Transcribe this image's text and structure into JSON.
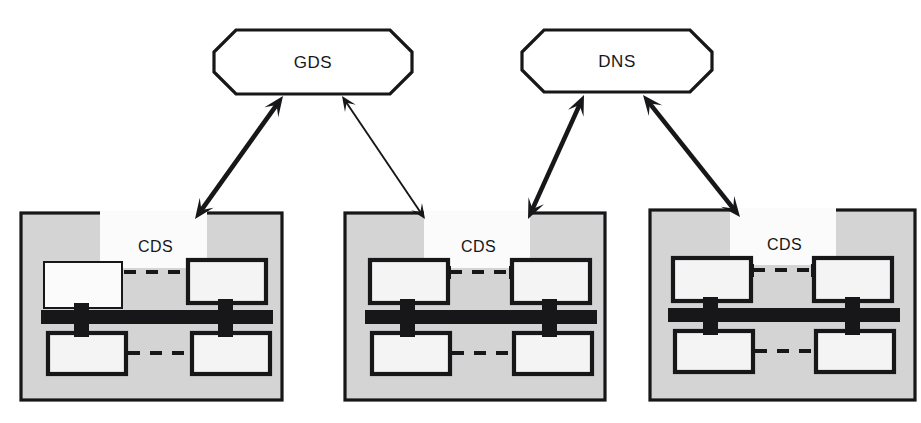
{
  "diagram": {
    "background_color": "#ffffff",
    "line_color": "#17171a",
    "cell_fill_color": "#d4d4d4",
    "inner_rect_color": "#f4f4f4",
    "label_band_color": "#fbfbfb"
  },
  "top_nodes": [
    {
      "id": "gds",
      "label": "GDS",
      "shape": "octagon",
      "x": 214,
      "y": 30,
      "width": 198,
      "height": 64,
      "corner": 22
    },
    {
      "id": "dns",
      "label": "DNS",
      "shape": "octagon",
      "x": 522,
      "y": 30,
      "width": 190,
      "height": 62,
      "corner": 22
    }
  ],
  "cds_boxes": [
    {
      "id": "cds-1",
      "label": "CDS",
      "x": 21,
      "y": 213,
      "width": 261,
      "height": 187,
      "label_band": {
        "x": 100,
        "y": 213,
        "width": 107,
        "height": 55
      },
      "label_text_x": 138,
      "label_text_y": 252,
      "top_left_thin_border": true,
      "rects": [
        {
          "role": "top-left",
          "x": 44,
          "y": 262,
          "width": 78,
          "height": 46
        },
        {
          "role": "top-right",
          "x": 188,
          "y": 260,
          "width": 78,
          "height": 43
        },
        {
          "role": "bottom-left",
          "x": 48,
          "y": 333,
          "width": 78,
          "height": 41
        },
        {
          "role": "bottom-right",
          "x": 192,
          "y": 333,
          "width": 78,
          "height": 41
        }
      ],
      "bus": {
        "x": 41,
        "y": 310,
        "width": 232,
        "height": 14
      },
      "stubs": [
        {
          "x": 74,
          "y": 303,
          "width": 15,
          "height": 34
        },
        {
          "x": 218,
          "y": 299,
          "width": 15,
          "height": 38
        }
      ],
      "dashes": [
        {
          "x1": 124,
          "y1": 272,
          "x2": 186,
          "y2": 272
        },
        {
          "x1": 128,
          "y1": 353,
          "x2": 190,
          "y2": 353
        }
      ],
      "dash_ticks": []
    },
    {
      "id": "cds-2",
      "label": "CDS",
      "x": 345,
      "y": 213,
      "width": 260,
      "height": 187,
      "label_band": {
        "x": 424,
        "y": 213,
        "width": 106,
        "height": 55
      },
      "label_text_x": 461,
      "label_text_y": 252,
      "top_left_thin_border": false,
      "rects": [
        {
          "role": "top-left",
          "x": 370,
          "y": 260,
          "width": 78,
          "height": 43
        },
        {
          "role": "top-right",
          "x": 512,
          "y": 260,
          "width": 78,
          "height": 43
        },
        {
          "role": "bottom-left",
          "x": 372,
          "y": 333,
          "width": 78,
          "height": 41
        },
        {
          "role": "bottom-right",
          "x": 514,
          "y": 333,
          "width": 78,
          "height": 41
        }
      ],
      "bus": {
        "x": 365,
        "y": 310,
        "width": 232,
        "height": 14
      },
      "stubs": [
        {
          "x": 400,
          "y": 299,
          "width": 15,
          "height": 38
        },
        {
          "x": 542,
          "y": 299,
          "width": 15,
          "height": 38
        }
      ],
      "dashes": [
        {
          "x1": 450,
          "y1": 272,
          "x2": 510,
          "y2": 272
        },
        {
          "x1": 452,
          "y1": 353,
          "x2": 512,
          "y2": 353
        }
      ],
      "dash_ticks": [
        {
          "x": 449,
          "y1": 266,
          "y2": 279
        },
        {
          "x": 511,
          "y1": 266,
          "y2": 279
        }
      ]
    },
    {
      "id": "cds-3",
      "label": "CDS",
      "x": 650,
      "y": 210,
      "width": 265,
      "height": 190,
      "label_band": {
        "x": 730,
        "y": 210,
        "width": 106,
        "height": 55
      },
      "label_text_x": 767,
      "label_text_y": 250,
      "top_left_thin_border": false,
      "rects": [
        {
          "role": "top-left",
          "x": 673,
          "y": 258,
          "width": 78,
          "height": 43
        },
        {
          "role": "top-right",
          "x": 814,
          "y": 258,
          "width": 78,
          "height": 43
        },
        {
          "role": "bottom-left",
          "x": 675,
          "y": 331,
          "width": 78,
          "height": 41
        },
        {
          "role": "bottom-right",
          "x": 816,
          "y": 331,
          "width": 78,
          "height": 41
        }
      ],
      "bus": {
        "x": 668,
        "y": 308,
        "width": 232,
        "height": 14
      },
      "stubs": [
        {
          "x": 703,
          "y": 297,
          "width": 15,
          "height": 38
        },
        {
          "x": 845,
          "y": 297,
          "width": 15,
          "height": 38
        }
      ],
      "dashes": [
        {
          "x1": 753,
          "y1": 270,
          "x2": 812,
          "y2": 270
        },
        {
          "x1": 755,
          "y1": 351,
          "x2": 814,
          "y2": 351
        }
      ],
      "dash_ticks": [
        {
          "x": 752,
          "y1": 264,
          "y2": 277
        },
        {
          "x": 813,
          "y1": 264,
          "y2": 277
        }
      ]
    }
  ],
  "connectors": [
    {
      "id": "gds-cds1",
      "from": "gds",
      "to": "cds-1",
      "style": "thick",
      "double_headed": true,
      "x1": 283,
      "y1": 96,
      "x2": 195,
      "y2": 219
    },
    {
      "id": "gds-cds2",
      "from": "gds",
      "to": "cds-2",
      "style": "thin",
      "double_headed": true,
      "x1": 342,
      "y1": 96,
      "x2": 425,
      "y2": 219
    },
    {
      "id": "dns-cds2",
      "from": "dns",
      "to": "cds-2",
      "style": "thick",
      "double_headed": true,
      "x1": 584,
      "y1": 95,
      "x2": 528,
      "y2": 219
    },
    {
      "id": "dns-cds3",
      "from": "dns",
      "to": "cds-3",
      "style": "thick",
      "double_headed": true,
      "x1": 643,
      "y1": 95,
      "x2": 740,
      "y2": 217
    }
  ]
}
